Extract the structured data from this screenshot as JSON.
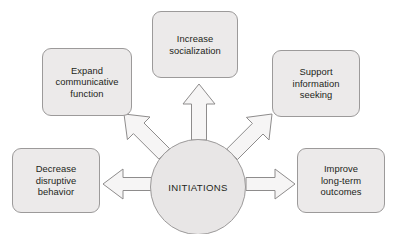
{
  "diagram": {
    "type": "hub-and-spoke",
    "title_text": "INITIATIONS",
    "hub": {
      "label": "INITIATIONS",
      "shape": "circle"
    },
    "colors": {
      "background": "#ffffff",
      "node_fill": "#eceaea",
      "node_border": "#9c9a9a",
      "hub_fill": "#e8e6e6",
      "hub_border": "#9c9a9a",
      "arrow_fill": "#f6f5f5",
      "arrow_border": "#8e8c8c",
      "text": "#231f20"
    },
    "nodes": [
      {
        "id": "top",
        "label": "Increase\nsocialization",
        "position": "top",
        "arrow_direction": "up"
      },
      {
        "id": "upper-left",
        "label": "Expand\ncommunicative\nfunction",
        "position": "upper-left",
        "arrow_direction": "up-left"
      },
      {
        "id": "upper-right",
        "label": "Support\ninformation\nseeking",
        "position": "upper-right",
        "arrow_direction": "up-right"
      },
      {
        "id": "lower-left",
        "label": "Decrease\ndisruptive\nbehavior",
        "position": "lower-left",
        "arrow_direction": "left"
      },
      {
        "id": "lower-right",
        "label": "Improve\nlong-term\noutcomes",
        "position": "lower-right",
        "arrow_direction": "right"
      }
    ],
    "arrows": [
      {
        "id": "arrow-up",
        "from": "INITIATIONS",
        "to": "Increase socialization",
        "direction": "up"
      },
      {
        "id": "arrow-up-left",
        "from": "INITIATIONS",
        "to": "Expand communicative function",
        "direction": "up-left"
      },
      {
        "id": "arrow-up-right",
        "from": "INITIATIONS",
        "to": "Support information seeking",
        "direction": "up-right"
      },
      {
        "id": "arrow-left",
        "from": "INITIATIONS",
        "to": "Decrease disruptive behavior",
        "direction": "left"
      },
      {
        "id": "arrow-right",
        "from": "INITIATIONS",
        "to": "Improve long-term outcomes",
        "direction": "right"
      }
    ]
  }
}
